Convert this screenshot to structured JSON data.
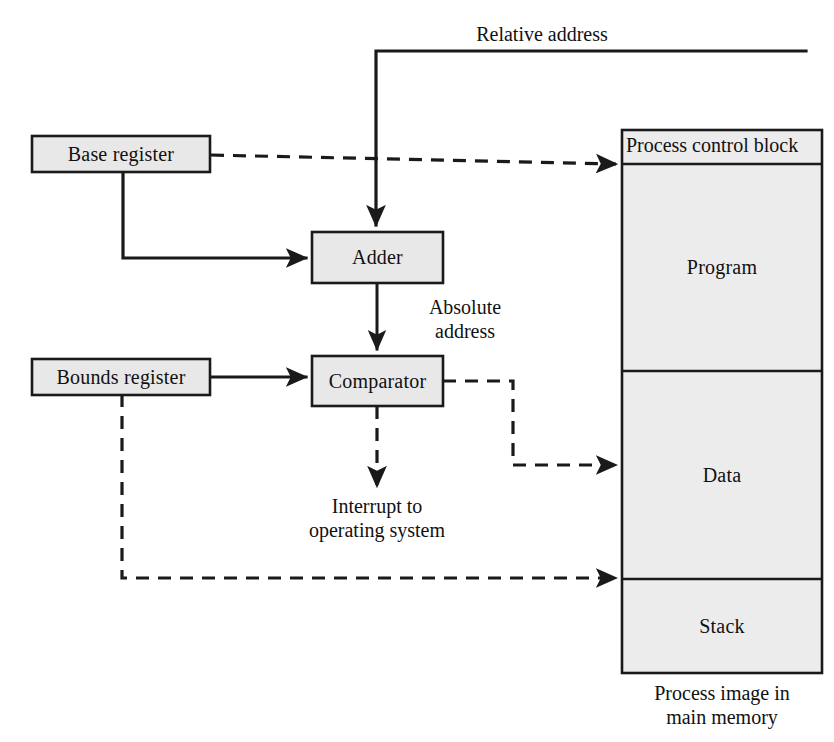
{
  "diagram": {
    "colors": {
      "box_fill": "#e8e8e8",
      "memory_fill": "#ececec",
      "stroke": "#1a1a1a",
      "background": "#ffffff"
    },
    "boxes": {
      "base_register": "Base register",
      "bounds_register": "Bounds register",
      "adder": "Adder",
      "comparator": "Comparator"
    },
    "labels": {
      "relative_address": "Relative address",
      "absolute_address": "Absolute\naddress",
      "interrupt": "Interrupt to\noperating system",
      "caption": "Process image in\nmain memory"
    },
    "memory": {
      "header": "Process control block",
      "segments": [
        {
          "name": "Program"
        },
        {
          "name": "Data"
        },
        {
          "name": "Stack"
        }
      ]
    },
    "connections": [
      {
        "from": "relative-address-bus",
        "to": "adder",
        "style": "solid",
        "arrow": true
      },
      {
        "from": "base-register",
        "to": "adder",
        "style": "solid",
        "arrow": true
      },
      {
        "from": "base-register",
        "to": "process-control-block",
        "style": "dashed",
        "arrow": true
      },
      {
        "from": "adder",
        "to": "comparator",
        "style": "solid",
        "arrow": true
      },
      {
        "from": "bounds-register",
        "to": "comparator",
        "style": "solid",
        "arrow": true
      },
      {
        "from": "comparator",
        "to": "interrupt",
        "style": "dashed",
        "arrow": true
      },
      {
        "from": "comparator",
        "to": "data-segment",
        "style": "dashed",
        "arrow": true
      },
      {
        "from": "bounds-register",
        "to": "stack-segment",
        "style": "dashed",
        "arrow": true
      }
    ]
  }
}
